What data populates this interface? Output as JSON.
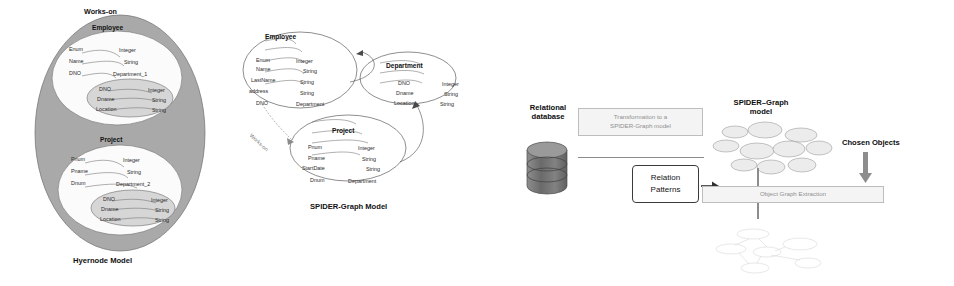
{
  "figure": {
    "panels": [
      {
        "id": "hypernode",
        "caption": "Hyernode Model",
        "outer_label": "Works-on",
        "nodes": [
          {
            "title": "Employee",
            "attributes": [
              {
                "name": "Enum",
                "type": "Integer"
              },
              {
                "name": "Name",
                "type": "String"
              },
              {
                "name": "DNO",
                "type": "Department_1"
              }
            ],
            "nested": {
              "title": "Department_1",
              "attributes": [
                {
                  "name": "DNO",
                  "type": "Integer"
                },
                {
                  "name": "Dname",
                  "type": "String"
                },
                {
                  "name": "Location",
                  "type": "String"
                }
              ]
            }
          },
          {
            "title": "Project",
            "attributes": [
              {
                "name": "Pnum",
                "type": "Integer"
              },
              {
                "name": "Pname",
                "type": "String"
              },
              {
                "name": "Dnum",
                "type": "Department_2"
              }
            ],
            "nested": {
              "title": "Department_2",
              "attributes": [
                {
                  "name": "DNO",
                  "type": "Integer"
                },
                {
                  "name": "Dname",
                  "type": "String"
                },
                {
                  "name": "Location",
                  "type": "String"
                }
              ]
            }
          }
        ]
      },
      {
        "id": "spider-graph",
        "caption": "SPIDER-Graph Model",
        "edge_label": "Works-on",
        "nodes": [
          {
            "title": "Employee",
            "attributes": [
              {
                "name": "Enum",
                "type": "Integer"
              },
              {
                "name": "Name",
                "type": "String"
              },
              {
                "name": "LastName",
                "type": "String"
              },
              {
                "name": "address",
                "type": "String"
              },
              {
                "name": "DNO",
                "type": "Department"
              }
            ]
          },
          {
            "title": "Department",
            "attributes": [
              {
                "name": "DNO",
                "type": "Integer"
              },
              {
                "name": "Dname",
                "type": "String"
              },
              {
                "name": "Location",
                "type": "String"
              }
            ]
          },
          {
            "title": "Project",
            "attributes": [
              {
                "name": "Pnum",
                "type": "Integer"
              },
              {
                "name": "Pname",
                "type": "String"
              },
              {
                "name": "StartDate",
                "type": "String"
              },
              {
                "name": "Dnum",
                "type": "Department"
              }
            ]
          }
        ]
      },
      {
        "id": "pipeline",
        "source_label": "Relational\ndatabase",
        "source_label_line1": "Relational",
        "source_label_line2": "database",
        "transform_box": "Transformation to a\nSPIDER-Graph model",
        "transform_box_line1": "Transformation to a",
        "transform_box_line2": "SPIDER-Graph model",
        "patterns_box_line1": "Relation",
        "patterns_box_line2": "Patterns",
        "model_label_line1": "SPIDER–Graph",
        "model_label_line2": "model",
        "chosen_objects_label": "Chosen Objects",
        "extraction_box": "Object  Graph Extraction"
      }
    ]
  },
  "colors": {
    "outer_ellipse": "#a9a9a9",
    "white_ellipse": "#fbfbfb",
    "inner_ellipse": "#d6d6d6",
    "faded_box_text": "#8f8f8f",
    "ink": "#1a1a1a"
  }
}
